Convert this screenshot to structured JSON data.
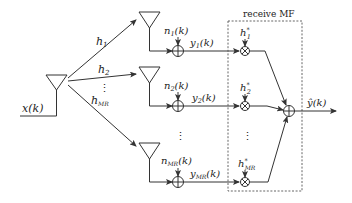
{
  "diagram": {
    "type": "block-diagram",
    "transmitter": {
      "input_label": "x(k)"
    },
    "channels": [
      {
        "label": "h",
        "sub": "1"
      },
      {
        "label": "h",
        "sub": "2"
      },
      {
        "label": "h",
        "sub": "MR"
      }
    ],
    "branches": [
      {
        "noise_label": "n",
        "noise_sub": "1",
        "noise_suffix": "(k)",
        "output_label": "y",
        "output_sub": "1",
        "output_suffix": "(k)",
        "mf_label": "h",
        "mf_sub": "1",
        "mf_sup": "*"
      },
      {
        "noise_label": "n",
        "noise_sub": "2",
        "noise_suffix": "(k)",
        "output_label": "y",
        "output_sub": "2",
        "output_suffix": "(k)",
        "mf_label": "h",
        "mf_sub": "2",
        "mf_sup": "*"
      },
      {
        "noise_label": "n",
        "noise_sub": "MR",
        "noise_suffix": "(k)",
        "output_label": "y",
        "output_sub": "MR",
        "output_suffix": "(k)",
        "mf_label": "h",
        "mf_sub": "MR",
        "mf_sup": "*"
      }
    ],
    "mf_box_title": "receive MF",
    "output_label": "ŷ(k)",
    "ellipsis": "⋮"
  }
}
